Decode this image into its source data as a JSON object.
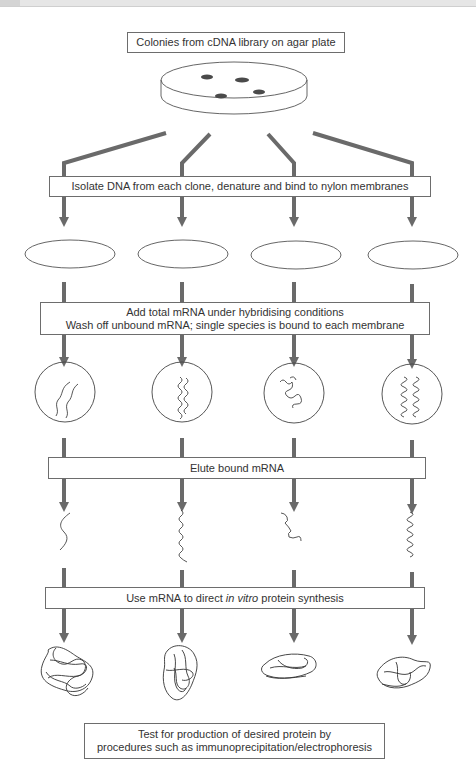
{
  "figure": {
    "steps": {
      "start": "Colonies from cDNA library on agar plate",
      "isolate": "Isolate DNA from each clone, denature and bind to nylon membranes",
      "hybridise_line1": "Add total mRNA under hybridising conditions",
      "hybridise_line2": "Wash off unbound mRNA; single species is bound to each membrane",
      "elute": "Elute bound mRNA",
      "synthesis_prefix": "Use mRNA to direct ",
      "synthesis_italic": "in vitro",
      "synthesis_suffix": " protein synthesis",
      "test_line1": "Test for production of desired protein by",
      "test_line2": "procedures such as immunoprecipitation/electrophoresis"
    },
    "column_count": 4,
    "colors": {
      "arrow": "#6a6a6a",
      "outline": "#444444",
      "colony": "#4a4a4a",
      "text": "#333333"
    }
  }
}
